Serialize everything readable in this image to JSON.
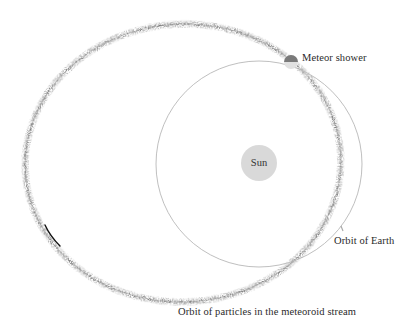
{
  "diagram": {
    "labels": {
      "sun": "Sun",
      "meteor_shower": "Meteor shower",
      "orbit_of_earth": "Orbit of Earth",
      "meteoroid_stream": "Orbit of particles in the meteoroid stream"
    },
    "colors": {
      "background": "#ffffff",
      "sun_fill": "#d9d9d9",
      "earth_orbit_stroke": "#b8b8b8",
      "stream_dots": "#6e6e6e",
      "meteor_shower_dark": "#7a7a7a",
      "meteor_shower_light": "#dcdcdc",
      "text": "#2a2a2a"
    },
    "geometry": {
      "sun": {
        "cx": 259,
        "cy": 163,
        "r": 18
      },
      "earth_orbit": {
        "cx": 259,
        "cy": 164,
        "r": 103
      },
      "stream_ellipse": {
        "cx": 183,
        "cy": 163,
        "rx": 158,
        "ry": 139,
        "rotation": -3
      },
      "meteor_shower": {
        "cx": 291,
        "cy": 61,
        "r": 7
      }
    }
  }
}
